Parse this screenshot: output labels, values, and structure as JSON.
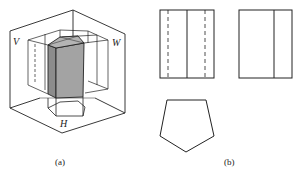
{
  "figure_a": {
    "caption": "(a)",
    "plane_labels": {
      "v": "V",
      "w": "W",
      "h": "H"
    },
    "description": "Pictorial view of a pentagonal prism placed in the three-projection-plane system, with projections on V, W and H planes",
    "prism_fill": "#9a9a9a",
    "line_color": "#222222"
  },
  "figure_b": {
    "caption": "(b)",
    "views": [
      {
        "name": "front-view",
        "shape": "rectangle",
        "inner_solid_lines": 1,
        "inner_dashed_lines": 2
      },
      {
        "name": "side-view",
        "shape": "rectangle",
        "inner_solid_lines": 1,
        "inner_dashed_lines": 0
      },
      {
        "name": "top-view",
        "shape": "pentagon"
      }
    ]
  }
}
